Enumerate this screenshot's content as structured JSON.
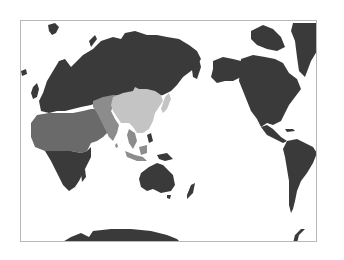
{
  "map": {
    "projection": "pacific-centered world map",
    "frame": {
      "x": 20,
      "y": 20,
      "width": 297,
      "height": 222,
      "border_color": "#b8b8b8"
    },
    "colors": {
      "ocean": "#ffffff",
      "land_dark": "#3a3a3a",
      "region_north_africa_middle_east": "#6a6a6a",
      "region_central_south_asia": "#8c8c8c",
      "region_east_asia": "#c4c4c4"
    },
    "regions": [
      {
        "name": "Europe",
        "shade": "land_dark"
      },
      {
        "name": "Russia / North Asia",
        "shade": "land_dark"
      },
      {
        "name": "North Africa & Middle East",
        "shade": "region_north_africa_middle_east"
      },
      {
        "name": "Sub-Saharan Africa",
        "shade": "land_dark"
      },
      {
        "name": "Central & South Asia",
        "shade": "region_central_south_asia"
      },
      {
        "name": "East Asia (China, Mongolia, Korea, Japan)",
        "shade": "region_east_asia"
      },
      {
        "name": "Southeast Asia",
        "shade": "region_central_south_asia"
      },
      {
        "name": "Australia & Oceania",
        "shade": "land_dark"
      },
      {
        "name": "North America",
        "shade": "land_dark"
      },
      {
        "name": "Greenland",
        "shade": "land_dark"
      },
      {
        "name": "Central America",
        "shade": "land_dark"
      },
      {
        "name": "South America",
        "shade": "land_dark"
      },
      {
        "name": "Antarctica",
        "shade": "land_dark"
      }
    ]
  }
}
